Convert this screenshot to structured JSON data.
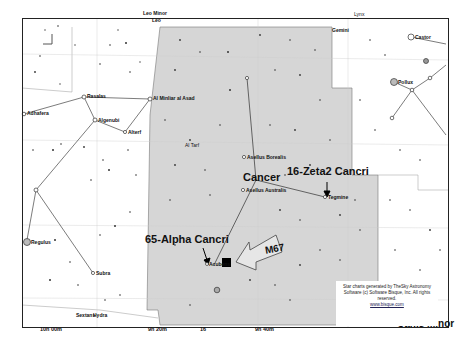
{
  "map": {
    "region_constellation": "Cancer",
    "constellations": {
      "top_left_1": "Leo Minor",
      "top_left_2": "Leo",
      "top_center": "Gemini",
      "top_right": "Lynx",
      "bottom_left": "Sextans",
      "bottom_left_2": "Hydra",
      "bottom_right": "Canis Minor"
    },
    "annotations": {
      "alpha": "65-Alpha Cancri",
      "zeta": "16-Zeta2 Cancri",
      "m67": "M67",
      "cancer": "Cancer"
    },
    "named_stars": [
      {
        "name": "Rasalas",
        "mag": "24"
      },
      {
        "name": "Al Minliar al Asad",
        "mag": ""
      },
      {
        "name": "Adhafera",
        "mag": ""
      },
      {
        "name": "Algenubi",
        "mag": "17"
      },
      {
        "name": "Alterf",
        "mag": "4"
      },
      {
        "name": "Al Tarf",
        "mag": "77"
      },
      {
        "name": "Asellus Borealis",
        "mag": "43"
      },
      {
        "name": "Asellus Australis",
        "mag": "47"
      },
      {
        "name": "Tegmine",
        "mag": ""
      },
      {
        "name": "Acubens",
        "mag": "65"
      },
      {
        "name": "Regulus",
        "mag": ""
      },
      {
        "name": "Subra",
        "mag": "14"
      },
      {
        "name": "Castor",
        "mag": "66"
      },
      {
        "name": "Pollux",
        "mag": "78"
      }
    ],
    "star_labels": [
      "23",
      "23",
      "22",
      "64",
      "58",
      "57",
      "72",
      "48",
      "58",
      "22",
      "18",
      "69",
      "10",
      "23",
      "81",
      "83",
      "75",
      "85",
      "82",
      "78",
      "17",
      "15",
      "5",
      "6",
      "2",
      "29",
      "10",
      "1",
      "57",
      "55",
      "68",
      "74",
      "68",
      "17",
      "8"
    ],
    "axis_labels": [
      "10h 00m",
      "9h 20m",
      "16",
      "9h 40m",
      "9h 00m"
    ],
    "credit": {
      "text": "Star charts generated by TheSky Astronomy Software (c) Software Bisque, Inc. All rights reserved.",
      "link": "www.bisque.com"
    }
  },
  "colors": {
    "cancer_fill": "#d8d8d8",
    "background": "#ffffff",
    "lines": "#444444"
  }
}
